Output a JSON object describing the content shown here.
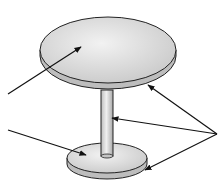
{
  "diagram": {
    "parts": [
      {
        "id": "tabletop",
        "label": ""
      },
      {
        "id": "base-top",
        "label": ""
      },
      {
        "id": "edges-and-column",
        "label": ""
      }
    ],
    "arrows": [
      {
        "from": [
          8,
          94
        ],
        "to": [
          81,
          47
        ],
        "target": "tabletop-surface"
      },
      {
        "from": [
          8,
          130
        ],
        "to": [
          86,
          155
        ],
        "target": "base-top-surface"
      },
      {
        "from": [
          217,
          134
        ],
        "to": [
          148,
          85
        ],
        "target": "tabletop-edge"
      },
      {
        "from": [
          217,
          134
        ],
        "to": [
          112,
          118
        ],
        "target": "column"
      },
      {
        "from": [
          217,
          134
        ],
        "to": [
          145,
          170
        ],
        "target": "base-edge"
      }
    ],
    "colors": {
      "background": "#ffffff",
      "surface": "#dcdcdc",
      "surface_light": "#ececec",
      "edge": "#bdbdbd",
      "outline": "#222222"
    }
  }
}
